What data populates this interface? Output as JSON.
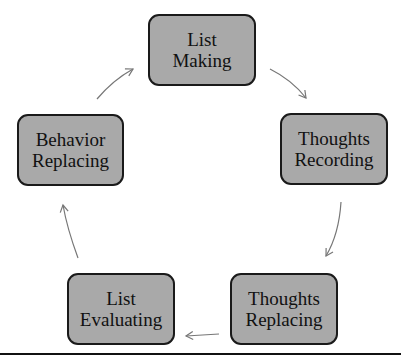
{
  "diagram": {
    "type": "cycle",
    "colors": {
      "node_fill": "#a9a9a9",
      "node_border": "#1a1a1a",
      "arrow": "#777777",
      "baseline": "#111111"
    },
    "nodes": [
      {
        "id": "list_making",
        "line1": "List",
        "line2": "Making"
      },
      {
        "id": "thoughts_recording",
        "line1": "Thoughts",
        "line2": "Recording"
      },
      {
        "id": "thoughts_replacing",
        "line1": "Thoughts",
        "line2": "Replacing"
      },
      {
        "id": "list_evaluating",
        "line1": "List",
        "line2": "Evaluating"
      },
      {
        "id": "behavior_replacing",
        "line1": "Behavior",
        "line2": "Replacing"
      }
    ],
    "edges": [
      {
        "from": "list_making",
        "to": "thoughts_recording"
      },
      {
        "from": "thoughts_recording",
        "to": "thoughts_replacing"
      },
      {
        "from": "thoughts_replacing",
        "to": "list_evaluating"
      },
      {
        "from": "list_evaluating",
        "to": "behavior_replacing"
      },
      {
        "from": "behavior_replacing",
        "to": "list_making"
      }
    ]
  }
}
